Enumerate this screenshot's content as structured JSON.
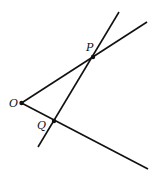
{
  "diagram": {
    "type": "geometry",
    "stroke_color": "#111111",
    "background": "#ffffff",
    "points": [
      {
        "id": "O",
        "label": "O",
        "x": 21.5,
        "y": 103
      },
      {
        "id": "P",
        "label": "P",
        "x": 93,
        "y": 57
      },
      {
        "id": "Q",
        "label": "Q",
        "x": 54,
        "y": 121
      }
    ],
    "lines": [
      {
        "id": "ray-OP",
        "from": "O",
        "x1": 21.5,
        "y1": 103,
        "x2": 147,
        "y2": 22
      },
      {
        "id": "ray-OQ",
        "from": "O",
        "x1": 21.5,
        "y1": 103,
        "x2": 148,
        "y2": 169
      },
      {
        "id": "line-QP",
        "x1": 38,
        "y1": 147,
        "x2": 119,
        "y2": 12
      }
    ],
    "labels": {
      "O": "O",
      "P": "P",
      "Q": "Q"
    }
  }
}
